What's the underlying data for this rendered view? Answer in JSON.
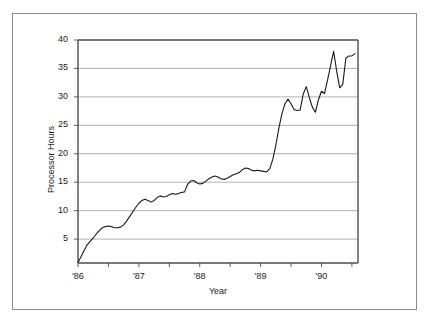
{
  "chart_data": {
    "type": "line",
    "title": "",
    "xlabel": "Year",
    "ylabel": "Processor Hours",
    "grid": "horizontal",
    "legend": "none",
    "xlim": [
      1986.0,
      1990.6
    ],
    "ylim": [
      0.8,
      40
    ],
    "y_ticks": [
      5,
      10,
      15,
      20,
      25,
      30,
      35,
      40
    ],
    "y_tick_labels": [
      "5",
      "10",
      "15",
      "20",
      "25",
      "30",
      "35",
      "40"
    ],
    "x_ticks": [
      1986,
      1987,
      1988,
      1989,
      1990
    ],
    "x_tick_labels": [
      "'86",
      "'87",
      "'88",
      "'89",
      "'90"
    ],
    "x_minor_ticks": [
      1986.5,
      1987.5,
      1988.5,
      1989.5,
      1990.5
    ],
    "line_color": "#1a1a1a",
    "grid_color": "#a8a8a8",
    "axis_color": "#4d4d4d",
    "series": [
      {
        "name": "Processor Hours",
        "x": [
          1986.0,
          1986.05,
          1986.1,
          1986.15,
          1986.2,
          1986.25,
          1986.3,
          1986.35,
          1986.4,
          1986.45,
          1986.5,
          1986.55,
          1986.6,
          1986.65,
          1986.7,
          1986.75,
          1986.8,
          1986.85,
          1986.9,
          1986.95,
          1987.0,
          1987.05,
          1987.1,
          1987.15,
          1987.2,
          1987.25,
          1987.3,
          1987.35,
          1987.4,
          1987.45,
          1987.5,
          1987.55,
          1987.6,
          1987.65,
          1987.7,
          1987.75,
          1987.8,
          1987.85,
          1987.9,
          1987.95,
          1988.0,
          1988.05,
          1988.1,
          1988.15,
          1988.2,
          1988.25,
          1988.3,
          1988.35,
          1988.4,
          1988.45,
          1988.5,
          1988.55,
          1988.6,
          1988.65,
          1988.7,
          1988.75,
          1988.8,
          1988.85,
          1988.9,
          1988.95,
          1989.0,
          1989.05,
          1989.1,
          1989.15,
          1989.2,
          1989.25,
          1989.3,
          1989.35,
          1989.4,
          1989.45,
          1989.5,
          1989.55,
          1989.6,
          1989.65,
          1989.7,
          1989.75,
          1989.8,
          1989.85,
          1989.9,
          1989.95,
          1990.0,
          1990.05,
          1990.1,
          1990.15,
          1990.2,
          1990.25,
          1990.3,
          1990.35,
          1990.4,
          1990.45,
          1990.5,
          1990.55
        ],
        "values": [
          0.9,
          1.9,
          3.0,
          4.0,
          4.6,
          5.2,
          5.9,
          6.5,
          7.0,
          7.2,
          7.3,
          7.2,
          7.0,
          7.0,
          7.1,
          7.5,
          8.2,
          9.0,
          9.8,
          10.6,
          11.3,
          11.8,
          12.0,
          11.8,
          11.5,
          11.8,
          12.3,
          12.6,
          12.4,
          12.5,
          12.8,
          13.0,
          12.9,
          13.0,
          13.2,
          13.3,
          14.6,
          15.2,
          15.3,
          14.9,
          14.7,
          14.8,
          15.2,
          15.6,
          15.9,
          16.1,
          15.9,
          15.6,
          15.5,
          15.7,
          16.0,
          16.3,
          16.5,
          16.7,
          17.2,
          17.5,
          17.4,
          17.1,
          17.0,
          17.1,
          17.0,
          16.9,
          16.8,
          17.4,
          19.0,
          21.5,
          24.5,
          27.0,
          28.8,
          29.6,
          28.8,
          27.8,
          27.6,
          27.7,
          30.5,
          31.8,
          29.9,
          28.2,
          27.3,
          29.5,
          31.0,
          30.6,
          33.0,
          35.5,
          38.0,
          34.5,
          31.6,
          32.2,
          36.8,
          37.2,
          37.2,
          37.6
        ]
      }
    ]
  },
  "axis": {
    "y_title": "Processor Hours",
    "x_title": "Year"
  }
}
